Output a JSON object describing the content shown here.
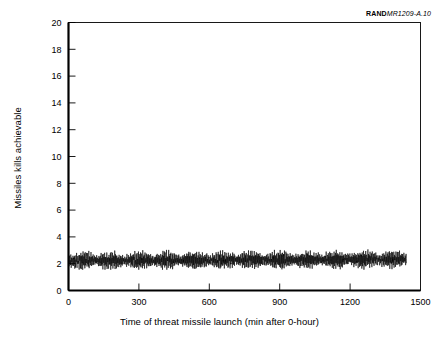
{
  "figure": {
    "source_id_brand": "RAND",
    "source_id_doc": "MR1209-A.10"
  },
  "chart_data": {
    "type": "line",
    "title": "",
    "subtitle": "",
    "xlabel": "Time of threat missile launch (min after 0-hour)",
    "ylabel": "Missiles kills achievable",
    "xlim": [
      0,
      1500
    ],
    "ylim": [
      0,
      20
    ],
    "xticks": [
      0,
      300,
      600,
      900,
      1200,
      1500
    ],
    "yticks": [
      0,
      2,
      4,
      6,
      8,
      10,
      12,
      14,
      16,
      18,
      20
    ],
    "xtick_labels": [
      "0",
      "300",
      "600",
      "900",
      "1200",
      "1500"
    ],
    "ytick_labels": [
      "0",
      "2",
      "4",
      "6",
      "8",
      "10",
      "12",
      "14",
      "16",
      "18",
      "20"
    ],
    "grid": false,
    "legend": null,
    "legend_position": "none",
    "tick_direction": "in",
    "series": [
      {
        "name": "Missile kills achievable",
        "color": "#000000",
        "line_width": 0.6,
        "x_start": 0,
        "x_end": 1440,
        "x_step": 1,
        "description": "Dense high-frequency oscillating band of per-minute kill capability; values cycle rapidly between a lower bound near 1.6 and an upper bound near 3.3 with a repeating envelope of about 120 minutes.",
        "envelope_period_min": 120,
        "value_min": 1.55,
        "value_max": 3.35,
        "value_mean": 2.35,
        "band_low": 1.9,
        "band_high": 2.9,
        "spike_frequency_per_min": 0.33,
        "sample_points": [
          {
            "x": 0,
            "y": 2.2
          },
          {
            "x": 10,
            "y": 3.05
          },
          {
            "x": 20,
            "y": 2.05
          },
          {
            "x": 30,
            "y": 2.95
          },
          {
            "x": 40,
            "y": 1.95
          },
          {
            "x": 50,
            "y": 3.1
          },
          {
            "x": 60,
            "y": 2.15
          },
          {
            "x": 70,
            "y": 2.85
          },
          {
            "x": 80,
            "y": 2.0
          },
          {
            "x": 90,
            "y": 3.15
          },
          {
            "x": 100,
            "y": 2.3
          },
          {
            "x": 110,
            "y": 2.7
          },
          {
            "x": 120,
            "y": 1.85
          },
          {
            "x": 150,
            "y": 2.9
          },
          {
            "x": 180,
            "y": 2.1
          },
          {
            "x": 210,
            "y": 3.05
          },
          {
            "x": 240,
            "y": 2.25
          },
          {
            "x": 270,
            "y": 2.8
          },
          {
            "x": 300,
            "y": 2.05
          },
          {
            "x": 360,
            "y": 3.0
          },
          {
            "x": 420,
            "y": 2.2
          },
          {
            "x": 480,
            "y": 2.95
          },
          {
            "x": 540,
            "y": 2.15
          },
          {
            "x": 600,
            "y": 3.1
          },
          {
            "x": 660,
            "y": 2.25
          },
          {
            "x": 720,
            "y": 2.85
          },
          {
            "x": 780,
            "y": 2.05
          },
          {
            "x": 840,
            "y": 3.05
          },
          {
            "x": 900,
            "y": 2.3
          },
          {
            "x": 960,
            "y": 2.9
          },
          {
            "x": 1020,
            "y": 2.1
          },
          {
            "x": 1080,
            "y": 3.15
          },
          {
            "x": 1140,
            "y": 2.35
          },
          {
            "x": 1200,
            "y": 2.8
          },
          {
            "x": 1260,
            "y": 2.15
          },
          {
            "x": 1320,
            "y": 3.05
          },
          {
            "x": 1380,
            "y": 2.4
          },
          {
            "x": 1430,
            "y": 2.3
          },
          {
            "x": 1440,
            "y": 2.2
          }
        ]
      }
    ]
  }
}
